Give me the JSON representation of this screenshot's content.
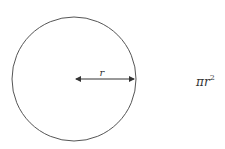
{
  "diagram": {
    "shape": "circle",
    "radius_label": "r",
    "formula": {
      "base": "πr",
      "exponent": "2"
    },
    "colors": {
      "stroke": "#555555",
      "text": "#333333",
      "background": "#ffffff"
    }
  }
}
